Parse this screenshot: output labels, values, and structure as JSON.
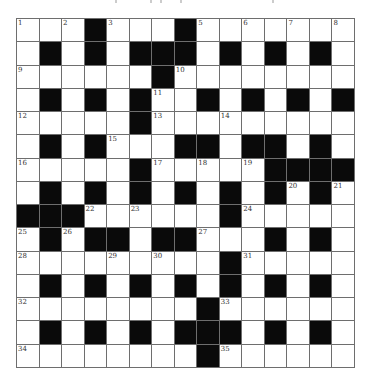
{
  "puzzle": {
    "type": "crossword",
    "rows": 15,
    "cols": 15,
    "colors": {
      "block": "#0a0a0a",
      "cell": "#ffffff",
      "line": "#6e6e6e",
      "number": "#333333"
    },
    "layout": [
      "...#...#.......",
      ".#.#.###.#.#.#.",
      "......#........",
      ".#.#.#..#.#.#.#",
      ".....#.........",
      ".#.#...##.##.#.",
      ".....#.....####",
      ".#.#.#.#.#.#.#.",
      "###......#.....",
      ".#.##.##...#.#.",
      ".........#.....",
      ".#.#.#.#.#.#.#.",
      "........#......",
      ".#.#.#.###.#.#.",
      "........#......"
    ],
    "numbers": [
      {
        "r": 0,
        "c": 0,
        "n": "1"
      },
      {
        "r": 0,
        "c": 2,
        "n": "2"
      },
      {
        "r": 0,
        "c": 4,
        "n": "3"
      },
      {
        "r": 0,
        "c": 7,
        "n": "4"
      },
      {
        "r": 0,
        "c": 8,
        "n": "5"
      },
      {
        "r": 0,
        "c": 10,
        "n": "6"
      },
      {
        "r": 0,
        "c": 12,
        "n": "7"
      },
      {
        "r": 0,
        "c": 14,
        "n": "8"
      },
      {
        "r": 2,
        "c": 0,
        "n": "9"
      },
      {
        "r": 2,
        "c": 7,
        "n": "10"
      },
      {
        "r": 3,
        "c": 6,
        "n": "11"
      },
      {
        "r": 4,
        "c": 0,
        "n": "12"
      },
      {
        "r": 4,
        "c": 6,
        "n": "13"
      },
      {
        "r": 4,
        "c": 9,
        "n": "14"
      },
      {
        "r": 5,
        "c": 4,
        "n": "15"
      },
      {
        "r": 6,
        "c": 0,
        "n": "16"
      },
      {
        "r": 6,
        "c": 6,
        "n": "17"
      },
      {
        "r": 6,
        "c": 8,
        "n": "18"
      },
      {
        "r": 6,
        "c": 10,
        "n": "19"
      },
      {
        "r": 7,
        "c": 12,
        "n": "20"
      },
      {
        "r": 7,
        "c": 14,
        "n": "21"
      },
      {
        "r": 8,
        "c": 3,
        "n": "22"
      },
      {
        "r": 8,
        "c": 5,
        "n": "23"
      },
      {
        "r": 8,
        "c": 10,
        "n": "24"
      },
      {
        "r": 9,
        "c": 0,
        "n": "25"
      },
      {
        "r": 9,
        "c": 2,
        "n": "26"
      },
      {
        "r": 9,
        "c": 8,
        "n": "27"
      },
      {
        "r": 10,
        "c": 0,
        "n": "28"
      },
      {
        "r": 10,
        "c": 4,
        "n": "29"
      },
      {
        "r": 10,
        "c": 6,
        "n": "30"
      },
      {
        "r": 10,
        "c": 10,
        "n": "31"
      },
      {
        "r": 12,
        "c": 0,
        "n": "32"
      },
      {
        "r": 12,
        "c": 9,
        "n": "33"
      },
      {
        "r": 14,
        "c": 0,
        "n": "34"
      },
      {
        "r": 14,
        "c": 9,
        "n": "35"
      }
    ]
  }
}
